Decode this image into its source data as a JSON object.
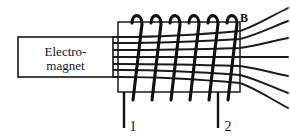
{
  "figure": {
    "background_color": "#ffffff",
    "ink_color": "#151515",
    "width": 290,
    "height": 140
  },
  "electromagnet": {
    "label_line1": "Electro-",
    "label_line2": "magnet",
    "box": {
      "x": 18,
      "y": 37,
      "width": 95,
      "height": 40
    }
  },
  "solenoid": {
    "core_rect": {
      "x": 118,
      "y": 22,
      "width": 122,
      "height": 70
    },
    "turn_count": 6,
    "turns": [
      {
        "index": 1,
        "top_x": 141,
        "bottom_x": 133
      },
      {
        "index": 2,
        "top_x": 160,
        "bottom_x": 152
      },
      {
        "index": 3,
        "top_x": 179,
        "bottom_x": 171
      },
      {
        "index": 4,
        "top_x": 198,
        "bottom_x": 190
      },
      {
        "index": 5,
        "top_x": 217,
        "bottom_x": 209
      },
      {
        "index": 6,
        "top_x": 236,
        "bottom_x": 228
      }
    ]
  },
  "field": {
    "label": "B",
    "label_x": 244,
    "label_y": 22,
    "line_count": 7,
    "start_x": 113,
    "lines": [
      {
        "index": 1,
        "y_start": 37,
        "y_exit": 31,
        "y_end": 8
      },
      {
        "index": 2,
        "y_start": 43,
        "y_exit": 39,
        "y_end": 21
      },
      {
        "index": 3,
        "y_start": 50,
        "y_exit": 48,
        "y_end": 38
      },
      {
        "index": 4,
        "y_start": 57,
        "y_exit": 57,
        "y_end": 57
      },
      {
        "index": 5,
        "y_start": 64,
        "y_exit": 66,
        "y_end": 76
      },
      {
        "index": 6,
        "y_start": 70,
        "y_exit": 75,
        "y_end": 93
      },
      {
        "index": 7,
        "y_start": 77,
        "y_exit": 83,
        "y_end": 108
      }
    ]
  },
  "terminals": [
    {
      "label": "1",
      "wire_x": 124,
      "wire_top": 92,
      "wire_bottom": 128,
      "label_x": 133,
      "label_y": 131
    },
    {
      "label": "2",
      "wire_x": 218,
      "wire_top": 92,
      "wire_bottom": 128,
      "label_x": 228,
      "label_y": 131
    }
  ]
}
